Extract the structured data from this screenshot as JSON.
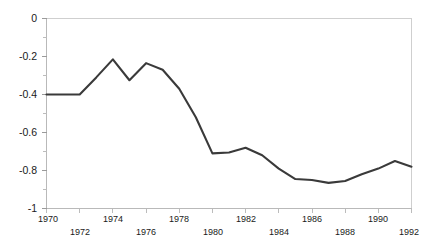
{
  "chart_data": {
    "type": "line",
    "title": "",
    "subtitle": "",
    "xlabel": "",
    "ylabel": "",
    "xlim": [
      1970,
      1992
    ],
    "ylim": [
      -1,
      0
    ],
    "grid": false,
    "legend": null,
    "legend_position": "none",
    "line_color": "#3a3a3a",
    "axis_color": "#b9b9b9",
    "x": [
      1970,
      1971,
      1972,
      1973,
      1974,
      1975,
      1976,
      1977,
      1978,
      1979,
      1980,
      1981,
      1982,
      1983,
      1984,
      1985,
      1986,
      1987,
      1988,
      1989,
      1990,
      1991,
      1992
    ],
    "values": [
      -0.4,
      -0.4,
      -0.4,
      -0.31,
      -0.215,
      -0.325,
      -0.235,
      -0.27,
      -0.37,
      -0.52,
      -0.71,
      -0.705,
      -0.68,
      -0.72,
      -0.79,
      -0.845,
      -0.85,
      -0.865,
      -0.855,
      -0.82,
      -0.79,
      -0.75,
      -0.78
    ],
    "series": [
      {
        "name": "series-1",
        "values": [
          -0.4,
          -0.4,
          -0.4,
          -0.31,
          -0.215,
          -0.325,
          -0.235,
          -0.27,
          -0.37,
          -0.52,
          -0.71,
          -0.705,
          -0.68,
          -0.72,
          -0.79,
          -0.845,
          -0.85,
          -0.865,
          -0.855,
          -0.82,
          -0.79,
          -0.75,
          -0.78
        ]
      }
    ],
    "y_ticks": [
      0,
      -0.2,
      -0.4,
      -0.6,
      -0.8,
      -1
    ],
    "y_tick_labels": [
      "0",
      "-0.2",
      "-0.4",
      "-0.6",
      "-0.8",
      "-1"
    ],
    "y_minor_ticks": [
      -0.1,
      -0.3,
      -0.5,
      -0.7,
      -0.9
    ],
    "x_ticks": [
      1970,
      1972,
      1974,
      1976,
      1978,
      1980,
      1982,
      1984,
      1986,
      1988,
      1990,
      1992
    ],
    "x_tick_labels_upper": [
      "1970",
      "1974",
      "1978",
      "1982",
      "1986",
      "1990"
    ],
    "x_tick_labels_lower": [
      "1972",
      "1976",
      "1980",
      "1984",
      "1988",
      "1992"
    ],
    "x_ticks_upper": [
      1970,
      1974,
      1978,
      1982,
      1986,
      1990
    ],
    "x_ticks_lower": [
      1972,
      1976,
      1980,
      1984,
      1988,
      1992
    ],
    "annotations": []
  },
  "axes": {
    "y_labels": {
      "t0": "0",
      "t1": "-0.2",
      "t2": "-0.4",
      "t3": "-0.6",
      "t4": "-0.8",
      "t5": "-1"
    },
    "x_labels_upper": {
      "u0": "1970",
      "u1": "1974",
      "u2": "1978",
      "u3": "1982",
      "u4": "1986",
      "u5": "1990"
    },
    "x_labels_lower": {
      "l0": "1972",
      "l1": "1976",
      "l2": "1980",
      "l3": "1984",
      "l4": "1988",
      "l5": "1992"
    }
  }
}
